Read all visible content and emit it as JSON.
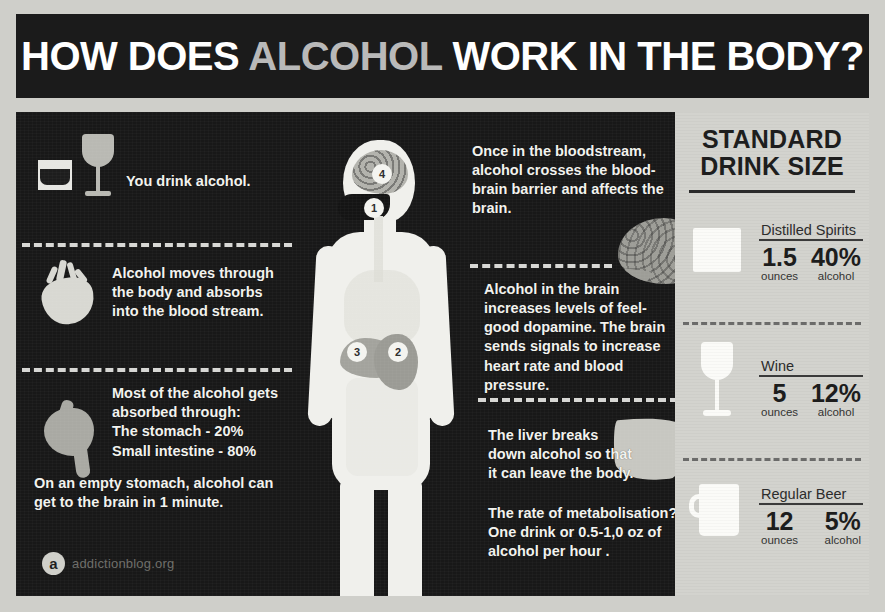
{
  "header": {
    "title_part1": "HOW DOES ",
    "title_accent": "ALCOHOL",
    "title_part2": " WORK IN THE BODY?"
  },
  "left_column": [
    {
      "icon": "shot-glass-and-wine-glass-icon",
      "text": "You drink alcohol."
    },
    {
      "icon": "heart-icon",
      "text": "Alcohol moves through the body and absorbs into the blood stream."
    },
    {
      "icon": "stomach-icon",
      "heading": "Most of the alcohol gets absorbed through:",
      "bullet1": "The stomach - 20%",
      "bullet2": "Small intestine - 80%",
      "footnote": "On an empty stomach, alcohol can get to the brain in 1 minute."
    }
  ],
  "right_column": [
    {
      "icon": "brain-icon",
      "text": "Once in the bloodstream, alcohol crosses the blood- brain barrier and affects the brain."
    },
    {
      "text": "Alcohol in the brain increases levels of feel-good dopamine. The brain sends signals to increase heart rate and blood pressure."
    },
    {
      "icon": "liver-icon",
      "text": "The liver breaks down alcohol so that it can leave the body."
    },
    {
      "text": "The rate of metabolisation? One drink or 0.5-1,0 oz of alcohol per hour ."
    }
  ],
  "body_diagram": {
    "name": "human-body-silhouette",
    "markers": [
      {
        "id": "1",
        "location": "mouth"
      },
      {
        "id": "2",
        "location": "stomach"
      },
      {
        "id": "3",
        "location": "liver"
      },
      {
        "id": "4",
        "location": "brain"
      }
    ]
  },
  "panel": {
    "title_line1": "STANDARD",
    "title_line2": "DRINK SIZE",
    "drinks": [
      {
        "name": "Distilled Spirits",
        "icon": "shot-glass-icon",
        "amount": "1.5",
        "amount_unit": "ounces",
        "abv": "40%",
        "abv_unit": "alcohol"
      },
      {
        "name": "Wine",
        "icon": "wine-glass-icon",
        "amount": "5",
        "amount_unit": "ounces",
        "abv": "12%",
        "abv_unit": "alcohol"
      },
      {
        "name": "Regular Beer",
        "icon": "beer-mug-icon",
        "amount": "12",
        "amount_unit": "ounces",
        "abv": "5%",
        "abv_unit": "alcohol"
      }
    ]
  },
  "footer": {
    "logo_letter": "a",
    "logo_text": "addictionblog.org"
  },
  "colors": {
    "dark_bg": "#181818",
    "panel_bg": "#d3d3ce",
    "text_light": "#f2f2ee",
    "text_dark": "#1e1e1e",
    "silhouette": "#f0f0ec"
  }
}
